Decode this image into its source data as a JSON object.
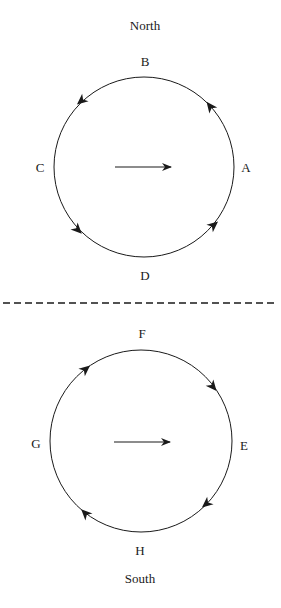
{
  "colors": {
    "ink": "#1a1a1a",
    "background": "#ffffff"
  },
  "top_diagram": {
    "heading": "North",
    "points": {
      "top": "B",
      "left": "C",
      "right": "A",
      "bottom": "D"
    },
    "circulation": "counter-clockwise",
    "center_arrow": "right"
  },
  "divider": {
    "style": "dashed"
  },
  "bottom_diagram": {
    "heading": "South",
    "points": {
      "top": "F",
      "left": "G",
      "right": "E",
      "bottom": "H"
    },
    "circulation": "clockwise",
    "center_arrow": "right"
  }
}
